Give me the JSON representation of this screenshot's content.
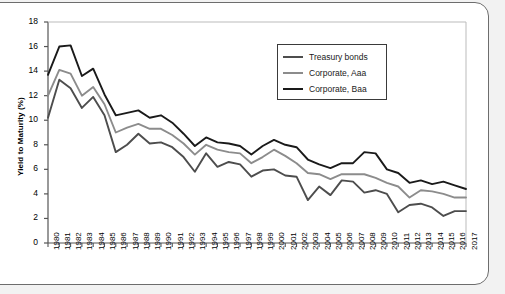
{
  "chart_data": {
    "type": "line",
    "title": "",
    "xlabel": "",
    "ylabel": "Yield to Maturity (%)",
    "xlim": [
      1980,
      2017
    ],
    "ylim": [
      0,
      18
    ],
    "yticks": [
      0,
      2,
      4,
      6,
      8,
      10,
      12,
      14,
      16,
      18
    ],
    "grid": false,
    "legend_position": "top-right",
    "x": [
      1980,
      1981,
      1982,
      1983,
      1984,
      1985,
      1986,
      1987,
      1988,
      1989,
      1990,
      1991,
      1992,
      1993,
      1994,
      1995,
      1996,
      1997,
      1998,
      1999,
      2000,
      2001,
      2002,
      2003,
      2004,
      2005,
      2006,
      2007,
      2008,
      2009,
      2010,
      2011,
      2012,
      2013,
      2014,
      2015,
      2016,
      2017
    ],
    "categories": [
      "1980",
      "1981",
      "1982",
      "1983",
      "1984",
      "1985",
      "1986",
      "1987",
      "1988",
      "1989",
      "1990",
      "1991",
      "1992",
      "1993",
      "1994",
      "1995",
      "1996",
      "1997",
      "1998",
      "1999",
      "2000",
      "2001",
      "2002",
      "2003",
      "2004",
      "2005",
      "2006",
      "2007",
      "2008",
      "2009",
      "2010",
      "2011",
      "2012",
      "2013",
      "2014",
      "2015",
      "2016",
      "2017"
    ],
    "series": [
      {
        "name": "Treasury bonds",
        "color": "#4d4d4d",
        "values": [
          10.2,
          13.3,
          12.6,
          11.0,
          11.9,
          10.4,
          7.4,
          8.0,
          8.9,
          8.1,
          8.2,
          7.8,
          7.0,
          5.8,
          7.3,
          6.2,
          6.6,
          6.4,
          5.4,
          5.9,
          6.0,
          5.5,
          5.4,
          3.5,
          4.6,
          3.9,
          5.1,
          5.0,
          4.1,
          4.3,
          4.0,
          2.5,
          3.1,
          3.2,
          2.9,
          2.2,
          2.6,
          2.6
        ]
      },
      {
        "name": "Corporate, Aaa",
        "color": "#8c8c8c",
        "values": [
          12.0,
          14.1,
          13.8,
          12.0,
          12.7,
          11.3,
          9.0,
          9.4,
          9.7,
          9.3,
          9.3,
          8.8,
          8.1,
          7.2,
          8.0,
          7.6,
          7.4,
          7.3,
          6.5,
          7.0,
          7.6,
          7.1,
          6.5,
          5.7,
          5.6,
          5.2,
          5.6,
          5.6,
          5.6,
          5.3,
          4.9,
          4.6,
          3.7,
          4.3,
          4.2,
          4.0,
          3.7,
          3.7
        ]
      },
      {
        "name": "Corporate, Baa",
        "color": "#1a1a1a",
        "values": [
          13.7,
          16.0,
          16.1,
          13.6,
          14.2,
          12.1,
          10.4,
          10.6,
          10.8,
          10.2,
          10.4,
          9.8,
          8.9,
          7.9,
          8.6,
          8.2,
          8.1,
          7.9,
          7.2,
          7.9,
          8.4,
          8.0,
          7.8,
          6.8,
          6.4,
          6.1,
          6.5,
          6.5,
          7.4,
          7.3,
          6.0,
          5.7,
          4.9,
          5.1,
          4.8,
          5.0,
          4.7,
          4.4
        ]
      }
    ]
  },
  "axis": {
    "y_title": "Yield to Maturity (%)"
  },
  "legend": {
    "items": [
      {
        "label": "Treasury bonds"
      },
      {
        "label": "Corporate, Aaa"
      },
      {
        "label": "Corporate, Baa"
      }
    ]
  }
}
